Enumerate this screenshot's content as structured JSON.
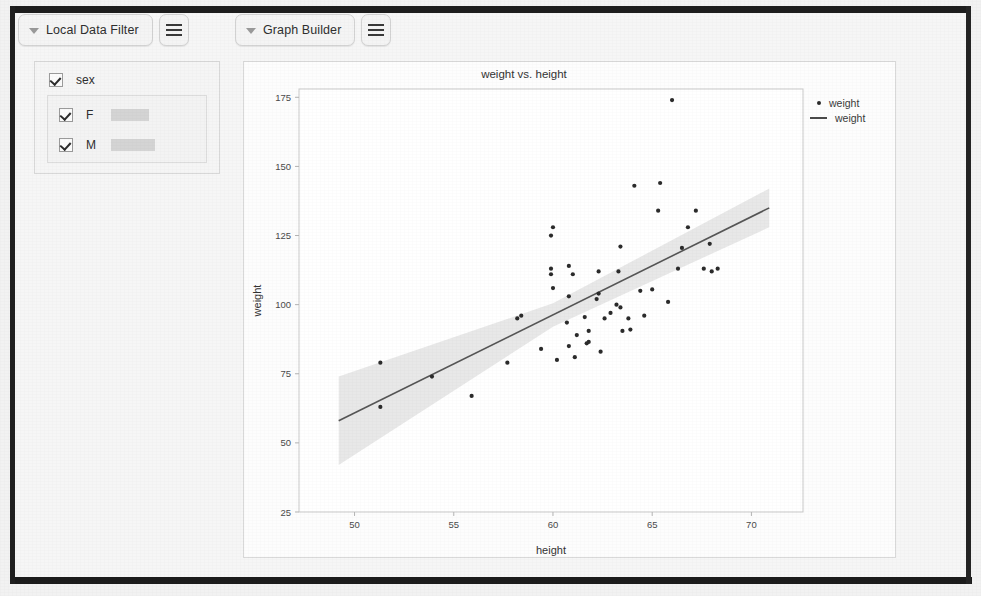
{
  "toolbar": {
    "filter_panel_button": "Local Data Filter",
    "filter_menu_icon": "hamburger-menu-icon",
    "graph_builder_button": "Graph Builder",
    "graph_menu_icon": "hamburger-menu-icon",
    "disclosure_icon": "triangle-down-icon"
  },
  "filter_panel": {
    "variable": {
      "label": "sex",
      "checked": true
    },
    "levels": [
      {
        "label": "F",
        "checked": true,
        "bar_width": 38
      },
      {
        "label": "M",
        "checked": true,
        "bar_width": 44
      }
    ]
  },
  "chart_data": {
    "type": "scatter",
    "title": "weight vs. height",
    "xlabel": "height",
    "ylabel": "weight",
    "xlim": [
      47.2,
      72.6
    ],
    "ylim": [
      25,
      178
    ],
    "xticks": [
      50,
      55,
      60,
      65,
      70
    ],
    "yticks": [
      25,
      50,
      75,
      100,
      125,
      150,
      175
    ],
    "grid": false,
    "legend_position": "right",
    "legend": [
      {
        "marker": "point",
        "label": "weight"
      },
      {
        "marker": "line",
        "label": "weight"
      }
    ],
    "series": [
      {
        "name": "weight",
        "type": "scatter",
        "marker_color": "#2b2b2b",
        "points": [
          [
            51.3,
            79.0
          ],
          [
            51.3,
            63.0
          ],
          [
            53.9,
            74.0
          ],
          [
            55.9,
            67.0
          ],
          [
            57.7,
            79.0
          ],
          [
            58.2,
            95.0
          ],
          [
            58.4,
            96.0
          ],
          [
            59.4,
            84.0
          ],
          [
            59.9,
            111.0
          ],
          [
            59.9,
            113.0
          ],
          [
            59.9,
            125.0
          ],
          [
            60.0,
            128.0
          ],
          [
            60.0,
            106.0
          ],
          [
            60.2,
            80.0
          ],
          [
            60.7,
            93.5
          ],
          [
            60.8,
            114.0
          ],
          [
            60.8,
            103.0
          ],
          [
            60.8,
            85.0
          ],
          [
            61.0,
            111.0
          ],
          [
            61.1,
            81.0
          ],
          [
            61.2,
            89.0
          ],
          [
            61.6,
            95.5
          ],
          [
            61.7,
            86.0
          ],
          [
            61.8,
            86.5
          ],
          [
            61.8,
            90.5
          ],
          [
            62.2,
            102.0
          ],
          [
            62.3,
            104.0
          ],
          [
            62.3,
            112.0
          ],
          [
            62.4,
            83.0
          ],
          [
            62.6,
            95.0
          ],
          [
            62.9,
            97.0
          ],
          [
            63.2,
            100.0
          ],
          [
            63.3,
            112.0
          ],
          [
            63.4,
            99.0
          ],
          [
            63.4,
            121.0
          ],
          [
            63.5,
            90.5
          ],
          [
            63.8,
            95.0
          ],
          [
            63.9,
            91.0
          ],
          [
            64.1,
            143.0
          ],
          [
            64.4,
            105.0
          ],
          [
            64.6,
            96.0
          ],
          [
            65.0,
            105.5
          ],
          [
            65.3,
            134.0
          ],
          [
            65.4,
            144.0
          ],
          [
            65.8,
            101.0
          ],
          [
            66.0,
            174.0
          ],
          [
            66.3,
            113.0
          ],
          [
            66.5,
            120.5
          ],
          [
            66.8,
            128.0
          ],
          [
            67.2,
            134.0
          ],
          [
            67.6,
            113.0
          ],
          [
            67.9,
            122.0
          ],
          [
            68.0,
            112.0
          ],
          [
            68.3,
            113.0
          ]
        ]
      },
      {
        "name": "weight",
        "type": "line",
        "line_color": "#555555",
        "description": "linear regression fit with confidence band",
        "fit": {
          "x0": 49.2,
          "y0": 58.0,
          "x1": 70.9,
          "y1": 135.0
        },
        "band": {
          "color": "#e4e4e4",
          "upper": [
            [
              49.2,
              74.0
            ],
            [
              60.0,
              100.5
            ],
            [
              70.9,
              142.0
            ]
          ],
          "lower": [
            [
              49.2,
              42.0
            ],
            [
              60.0,
              92.0
            ],
            [
              70.9,
              128.0
            ]
          ]
        }
      }
    ]
  }
}
